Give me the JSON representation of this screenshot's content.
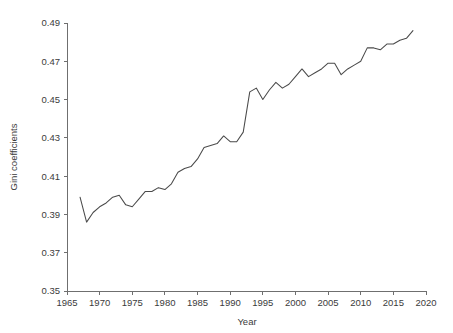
{
  "chart_data": {
    "type": "line",
    "title": "",
    "xlabel": "Year",
    "ylabel": "Gini coefficients",
    "xlim": [
      1965,
      2020
    ],
    "ylim": [
      0.35,
      0.49
    ],
    "xticks": [
      1965,
      1970,
      1975,
      1980,
      1985,
      1990,
      1995,
      2000,
      2005,
      2010,
      2015,
      2020
    ],
    "xtick_labels": [
      "1965",
      "1970",
      "1975",
      "1980",
      "1985",
      "1990",
      "1995",
      "2000",
      "2005",
      "2010",
      "2015",
      "2020"
    ],
    "yticks": [
      0.35,
      0.37,
      0.39,
      0.41,
      0.43,
      0.45,
      0.47,
      0.49
    ],
    "ytick_labels": [
      "0.35",
      "0.37",
      "0.39",
      "0.41",
      "0.43",
      "0.45",
      "0.47",
      "0.49"
    ],
    "grid": false,
    "legend": false,
    "line_color": "#4a4a4a",
    "axis_color": "#6f6f6f",
    "background": "#ffffff",
    "series": [
      {
        "name": "Gini coefficient",
        "x": [
          1967,
          1968,
          1969,
          1970,
          1971,
          1972,
          1973,
          1974,
          1975,
          1976,
          1977,
          1978,
          1979,
          1980,
          1981,
          1982,
          1983,
          1984,
          1985,
          1986,
          1987,
          1988,
          1989,
          1990,
          1991,
          1992,
          1993,
          1994,
          1995,
          1996,
          1997,
          1998,
          1999,
          2000,
          2001,
          2002,
          2003,
          2004,
          2005,
          2006,
          2007,
          2008,
          2009,
          2010,
          2011,
          2012,
          2013,
          2014,
          2015,
          2016,
          2017,
          2018
        ],
        "y": [
          0.399,
          0.386,
          0.391,
          0.394,
          0.396,
          0.399,
          0.4,
          0.395,
          0.394,
          0.398,
          0.402,
          0.402,
          0.404,
          0.403,
          0.406,
          0.412,
          0.414,
          0.415,
          0.419,
          0.425,
          0.426,
          0.427,
          0.431,
          0.428,
          0.428,
          0.433,
          0.454,
          0.456,
          0.45,
          0.455,
          0.459,
          0.456,
          0.458,
          0.462,
          0.466,
          0.462,
          0.464,
          0.466,
          0.469,
          0.469,
          0.463,
          0.466,
          0.468,
          0.47,
          0.477,
          0.477,
          0.476,
          0.479,
          0.479,
          0.481,
          0.482,
          0.486
        ]
      }
    ]
  },
  "axis_titles": {
    "x": "Year",
    "y": "Gini coefficients"
  }
}
